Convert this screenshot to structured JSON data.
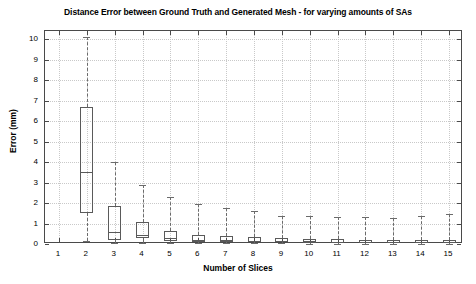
{
  "chart_data": {
    "type": "box",
    "title": "Distance Error between Ground Truth and Generated Mesh - for varying amounts of SAs",
    "xlabel": "Number of Slices",
    "ylabel": "Error (mm)",
    "xlim": [
      0.5,
      15.5
    ],
    "ylim": [
      0,
      10.4
    ],
    "grid": true,
    "legend": null,
    "categories": [
      "1",
      "2",
      "3",
      "4",
      "5",
      "6",
      "7",
      "8",
      "9",
      "10",
      "11",
      "12",
      "13",
      "14",
      "15"
    ],
    "yticks": [
      "0",
      "1",
      "2",
      "3",
      "4",
      "5",
      "6",
      "7",
      "8",
      "9",
      "10"
    ],
    "boxes": [
      {
        "x": 1,
        "whisker_low": null,
        "q1": null,
        "median": null,
        "q3": null,
        "whisker_high": null
      },
      {
        "x": 2,
        "whisker_low": 0.15,
        "q1": 1.5,
        "median": 3.5,
        "q3": 6.7,
        "whisker_high": 10.1
      },
      {
        "x": 3,
        "whisker_low": 0.05,
        "q1": 0.18,
        "median": 0.6,
        "q3": 1.85,
        "whisker_high": 4.0
      },
      {
        "x": 4,
        "whisker_low": 0.05,
        "q1": 0.28,
        "median": 0.45,
        "q3": 1.05,
        "whisker_high": 2.9
      },
      {
        "x": 5,
        "whisker_low": 0.05,
        "q1": 0.15,
        "median": 0.28,
        "q3": 0.62,
        "whisker_high": 2.3
      },
      {
        "x": 6,
        "whisker_low": 0.03,
        "q1": 0.1,
        "median": 0.2,
        "q3": 0.42,
        "whisker_high": 1.95
      },
      {
        "x": 7,
        "whisker_low": 0.03,
        "q1": 0.1,
        "median": 0.18,
        "q3": 0.38,
        "whisker_high": 1.75
      },
      {
        "x": 8,
        "whisker_low": 0.03,
        "q1": 0.08,
        "median": 0.16,
        "q3": 0.32,
        "whisker_high": 1.6
      },
      {
        "x": 9,
        "whisker_low": 0.03,
        "q1": 0.08,
        "median": 0.15,
        "q3": 0.28,
        "whisker_high": 1.35
      },
      {
        "x": 10,
        "whisker_low": 0.02,
        "q1": 0.07,
        "median": 0.13,
        "q3": 0.24,
        "whisker_high": 1.35
      },
      {
        "x": 11,
        "whisker_low": 0.02,
        "q1": 0.07,
        "median": 0.12,
        "q3": 0.22,
        "whisker_high": 1.3
      },
      {
        "x": 12,
        "whisker_low": 0.02,
        "q1": 0.06,
        "median": 0.12,
        "q3": 0.21,
        "whisker_high": 1.3
      },
      {
        "x": 13,
        "whisker_low": 0.02,
        "q1": 0.06,
        "median": 0.11,
        "q3": 0.2,
        "whisker_high": 1.25
      },
      {
        "x": 14,
        "whisker_low": 0.02,
        "q1": 0.06,
        "median": 0.11,
        "q3": 0.2,
        "whisker_high": 1.35
      },
      {
        "x": 15,
        "whisker_low": 0.02,
        "q1": 0.05,
        "median": 0.1,
        "q3": 0.19,
        "whisker_high": 1.45
      }
    ]
  },
  "style": {
    "axis_color": "#4a4a4a",
    "grid_color": "#c9c9c9",
    "box_color": "#5a5a5a",
    "whisker_color": "#6b6b6b",
    "background": "#ffffff"
  }
}
